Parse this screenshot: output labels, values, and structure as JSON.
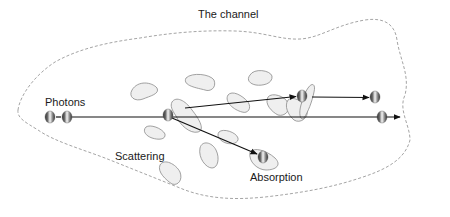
{
  "diagram": {
    "title": "The channel",
    "labels": {
      "photons": "Photons",
      "scattering": "Scattering",
      "absorption": "Absorption"
    },
    "colors": {
      "boundary": "#9a9a9a",
      "scatterer_fill": "#efefef",
      "scatterer_stroke": "#8a8a8a",
      "beam": "#111111",
      "photon_dark": "#3a3a3a",
      "photon_light": "#f4f4f4"
    },
    "elements": {
      "boundary": "dashed closed region representing the channel",
      "scatterers": 14,
      "photons": [
        {
          "role": "incoming",
          "count": 2
        },
        {
          "role": "scattering-event",
          "count": 1
        },
        {
          "role": "scattered-up",
          "count": 2
        },
        {
          "role": "transmitted",
          "count": 1
        },
        {
          "role": "absorbed",
          "count": 1
        }
      ]
    }
  }
}
